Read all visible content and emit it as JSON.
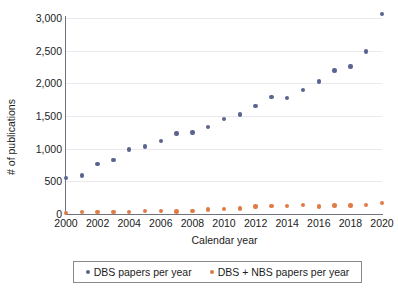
{
  "chart_data": {
    "type": "scatter",
    "title": "",
    "xlabel": "Calendar year",
    "ylabel": "# of publications",
    "xlim": [
      2000,
      2020
    ],
    "ylim": [
      0,
      3000
    ],
    "yticks": [
      "3,000",
      "2,500",
      "2,000",
      "1,500",
      "1,000",
      "500",
      "0"
    ],
    "ytick_values": [
      3000,
      2500,
      2000,
      1500,
      1000,
      500,
      0
    ],
    "xticks": [
      "2000",
      "2002",
      "2004",
      "2006",
      "2008",
      "2010",
      "2012",
      "2014",
      "2016",
      "2018",
      "2020"
    ],
    "xtick_values": [
      2000,
      2002,
      2004,
      2006,
      2008,
      2010,
      2012,
      2014,
      2016,
      2018,
      2020
    ],
    "grid": true,
    "legend_position": "bottom",
    "x": [
      2000,
      2001,
      2002,
      2003,
      2004,
      2005,
      2006,
      2007,
      2008,
      2009,
      2010,
      2011,
      2012,
      2013,
      2014,
      2015,
      2016,
      2017,
      2018,
      2019,
      2020
    ],
    "series": [
      {
        "name": "DBS papers per year",
        "color": "#5b6490",
        "values": [
          555,
          590,
          770,
          825,
          990,
          1035,
          1115,
          1235,
          1250,
          1330,
          1455,
          1525,
          1650,
          1790,
          1780,
          1895,
          2030,
          2195,
          2260,
          2485,
          3060
        ]
      },
      {
        "name": "DBS + NBS papers per year",
        "color": "#e07b45",
        "values": [
          20,
          28,
          35,
          34,
          35,
          45,
          48,
          42,
          48,
          72,
          78,
          88,
          115,
          120,
          122,
          140,
          118,
          130,
          132,
          135,
          168
        ]
      }
    ]
  },
  "legend": {
    "entries": [
      {
        "label": "DBS papers per year",
        "color": "#5b6490"
      },
      {
        "label": "DBS + NBS papers per year",
        "color": "#e07b45"
      }
    ]
  }
}
